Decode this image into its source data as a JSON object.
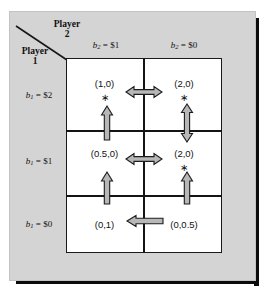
{
  "figure": {
    "type": "payoff-matrix",
    "corner": {
      "row_player_line1": "Player",
      "row_player_line2": "1",
      "col_player_line1": "Player",
      "col_player_line2": "2"
    },
    "column_headers": [
      {
        "var": "b",
        "sub": "2",
        "eq": " = $1",
        "text": "b2 = $1"
      },
      {
        "var": "b",
        "sub": "2",
        "eq": " = $0",
        "text": "b2 = $0"
      }
    ],
    "row_headers": [
      {
        "var": "b",
        "sub": "1",
        "eq": " = $2",
        "text": "b1 = $2"
      },
      {
        "var": "b",
        "sub": "1",
        "eq": " = $1",
        "text": "b1 = $1"
      },
      {
        "var": "b",
        "sub": "1",
        "eq": " = $0",
        "text": "b1 = $0"
      }
    ],
    "cells": [
      {
        "row": 0,
        "col": 0,
        "payoff": "(1,0)",
        "star": "∗"
      },
      {
        "row": 0,
        "col": 1,
        "payoff": "(2,0)",
        "star": "∗"
      },
      {
        "row": 1,
        "col": 0,
        "payoff": "(0.5,0)",
        "star": ""
      },
      {
        "row": 1,
        "col": 1,
        "payoff": "(2,0)",
        "star": "∗"
      },
      {
        "row": 2,
        "col": 0,
        "payoff": "(0,1)",
        "star": ""
      },
      {
        "row": 2,
        "col": 1,
        "payoff": "(0,0.5)",
        "star": ""
      }
    ],
    "arrows": [
      {
        "name": "row0-horizontal",
        "orientation": "horizontal",
        "heads": "both"
      },
      {
        "name": "row1-horizontal",
        "orientation": "horizontal",
        "heads": "both"
      },
      {
        "name": "row2-horizontal",
        "orientation": "horizontal",
        "heads": "left"
      },
      {
        "name": "col0-upper-vertical",
        "orientation": "vertical",
        "heads": "up"
      },
      {
        "name": "col1-upper-vertical",
        "orientation": "vertical",
        "heads": "both"
      },
      {
        "name": "col0-lower-vertical",
        "orientation": "vertical",
        "heads": "up"
      },
      {
        "name": "col1-lower-vertical",
        "orientation": "vertical",
        "heads": "up"
      }
    ],
    "colors": {
      "panel_background": "#d4d4d4",
      "cell_background": "#ffffff",
      "grid_line": "#141414",
      "arrow_fill": "#b7b7b7",
      "arrow_stroke": "#1c1c1c",
      "text": "#111111",
      "shadow": "#0b0b0b"
    }
  }
}
